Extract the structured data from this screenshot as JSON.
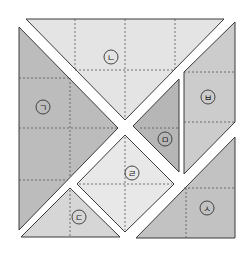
{
  "diagram": {
    "type": "tangram-square-puzzle",
    "pieces": [
      {
        "id": "giyeok",
        "label": "ㄱ",
        "shape": "right-triangle",
        "fill": "#bcbcbc",
        "points": "19,27 19,230 118,128",
        "label_pos": [
          43,
          107
        ]
      },
      {
        "id": "nieun",
        "label": "ㄴ",
        "shape": "trapezoid-triangle",
        "fill": "#e4e4e4",
        "points": "26,19 224,19 125,120",
        "label_pos": [
          111,
          57
        ]
      },
      {
        "id": "digeut",
        "label": "ㄷ",
        "shape": "triangle",
        "fill": "#d6d6d6",
        "points": "70,188 21,237 120,237",
        "label_pos": [
          79,
          217
        ]
      },
      {
        "id": "rieul",
        "label": "ㄹ",
        "shape": "square",
        "fill": "#e8e8e8",
        "points": "125,135 174,184 125,232 77,184",
        "label_pos": [
          132,
          173
        ]
      },
      {
        "id": "mieum",
        "label": "ㅁ",
        "shape": "triangle",
        "fill": "#b6b6b6",
        "points": "179,79 179,172 133,126",
        "label_pos": [
          165,
          139
        ]
      },
      {
        "id": "bieup",
        "label": "ㅂ",
        "shape": "parallelogram",
        "fill": "#cccccc",
        "points": "235,22 235,122 184,174 184,72",
        "label_pos": [
          208,
          97
        ]
      },
      {
        "id": "siot",
        "label": "ㅅ",
        "shape": "right-triangle",
        "fill": "#c2c2c2",
        "points": "235,137 235,238 136,238",
        "label_pos": [
          207,
          208
        ]
      }
    ],
    "grid_lines": [
      {
        "x1": 75,
        "y1": 19,
        "x2": 75,
        "y2": 70
      },
      {
        "x1": 125,
        "y1": 19,
        "x2": 125,
        "y2": 118
      },
      {
        "x1": 175,
        "y1": 19,
        "x2": 175,
        "y2": 70
      },
      {
        "x1": 75,
        "y1": 70,
        "x2": 175,
        "y2": 70
      },
      {
        "x1": 19,
        "y1": 78,
        "x2": 70,
        "y2": 78
      },
      {
        "x1": 19,
        "y1": 128,
        "x2": 118,
        "y2": 128
      },
      {
        "x1": 19,
        "y1": 180,
        "x2": 68,
        "y2": 180
      },
      {
        "x1": 70,
        "y1": 78,
        "x2": 70,
        "y2": 178
      },
      {
        "x1": 70,
        "y1": 190,
        "x2": 70,
        "y2": 237
      },
      {
        "x1": 79,
        "y1": 184,
        "x2": 172,
        "y2": 184
      },
      {
        "x1": 125,
        "y1": 137,
        "x2": 125,
        "y2": 230
      },
      {
        "x1": 140,
        "y1": 128,
        "x2": 179,
        "y2": 128
      },
      {
        "x1": 184,
        "y1": 72,
        "x2": 235,
        "y2": 72
      },
      {
        "x1": 184,
        "y1": 122,
        "x2": 235,
        "y2": 122
      },
      {
        "x1": 184,
        "y1": 188,
        "x2": 235,
        "y2": 188
      },
      {
        "x1": 186,
        "y1": 188,
        "x2": 186,
        "y2": 238
      }
    ]
  }
}
